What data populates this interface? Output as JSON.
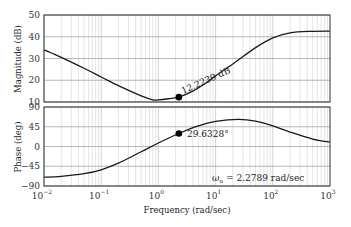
{
  "chart_data": [
    {
      "type": "line",
      "panel": "magnitude",
      "title": "",
      "xlabel": "",
      "ylabel": "Magnitude (dB)",
      "xscale": "log",
      "xlim": [
        0.01,
        1000
      ],
      "ylim": [
        10,
        50
      ],
      "yticks": [
        10,
        20,
        30,
        40,
        50
      ],
      "grid": true,
      "series": [
        {
          "name": "Magnitude",
          "x": [
            0.01,
            0.02,
            0.05,
            0.1,
            0.2,
            0.5,
            0.8,
            1,
            1.5,
            2.2789,
            4,
            7,
            10,
            20,
            50,
            100,
            200,
            500,
            1000
          ],
          "values": [
            34,
            30.5,
            25.5,
            21.5,
            17.5,
            12.8,
            11.0,
            11.0,
            11.5,
            12.2239,
            15,
            19,
            22,
            27.5,
            35,
            39.5,
            41.8,
            42.5,
            42.6
          ]
        }
      ],
      "annotations": [
        {
          "x": 2.2789,
          "y": 12.2239,
          "text": "12.2239 dB",
          "marker": "filled-circle"
        }
      ]
    },
    {
      "type": "line",
      "panel": "phase",
      "title": "",
      "xlabel": "Frequency  (rad/sec)",
      "ylabel": "Phase (deg)",
      "xscale": "log",
      "xlim": [
        0.01,
        1000
      ],
      "ylim": [
        -90,
        90
      ],
      "yticks": [
        -90,
        -45,
        0,
        45,
        90
      ],
      "xticks": [
        "10^-2",
        "10^-1",
        "10^0",
        "10^1",
        "10^2",
        "10^3"
      ],
      "grid": true,
      "series": [
        {
          "name": "Phase",
          "x": [
            0.01,
            0.02,
            0.05,
            0.1,
            0.2,
            0.5,
            1,
            2.2789,
            5,
            10,
            25,
            50,
            100,
            200,
            500,
            1000
          ],
          "values": [
            -70,
            -68,
            -62,
            -53,
            -38,
            -12,
            8,
            29.6328,
            47,
            57,
            62,
            58,
            47,
            33,
            17,
            10
          ]
        }
      ],
      "annotations": [
        {
          "x": 2.2789,
          "y": 29.6328,
          "text": "29.6328°",
          "marker": "filled-circle"
        },
        {
          "text": "ωu = 2.2789 rad/sec"
        }
      ]
    }
  ],
  "labels": {
    "mag_ylabel": "Magnitude (dB)",
    "phase_ylabel": "Phase (deg)",
    "xlabel": "Frequency  (rad/sec)",
    "mag_marker_label": "12.2239 dB",
    "phase_marker_label": "29.6328°",
    "omega_symbol": "ω",
    "omega_sub": "u",
    "omega_value": " = 2.2789 rad/sec",
    "mag_yticks": [
      "10",
      "20",
      "30",
      "40",
      "50"
    ],
    "phase_yticks": [
      "-90",
      "-45",
      "0",
      "45",
      "90"
    ],
    "xtick_base": "10",
    "xtick_exps": [
      "−2",
      "−1",
      "0",
      "1",
      "2",
      "3"
    ]
  },
  "colors": {
    "curve": "#1a1a1a",
    "grid": "#c8c8c8",
    "frame": "#333333",
    "marker": "#000000"
  }
}
